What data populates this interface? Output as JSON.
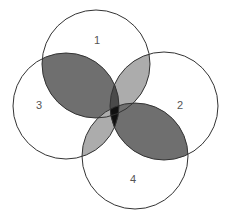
{
  "diagram": {
    "type": "venn",
    "sets": [
      {
        "id": "1",
        "label": "1",
        "cx": 96,
        "cy": 64,
        "r": 54,
        "label_x": 97,
        "label_y": 44
      },
      {
        "id": "2",
        "label": "2",
        "cx": 164,
        "cy": 106,
        "r": 54,
        "label_x": 180,
        "label_y": 109
      },
      {
        "id": "3",
        "label": "3",
        "cx": 66,
        "cy": 106,
        "r": 53,
        "label_x": 39,
        "label_y": 109
      },
      {
        "id": "4",
        "label": "4",
        "cx": 135,
        "cy": 156,
        "r": 53,
        "label_x": 133,
        "label_y": 183
      }
    ],
    "colors": {
      "outline": "#333333",
      "dark_overlap": "#6f6f6f",
      "light_overlap": "#acacac",
      "center_overlap": "#111111",
      "background": "#ffffff"
    },
    "overlaps": [
      {
        "sets": [
          "1",
          "3"
        ],
        "shade": "dark"
      },
      {
        "sets": [
          "2",
          "4"
        ],
        "shade": "dark"
      },
      {
        "sets": [
          "1",
          "2"
        ],
        "shade": "light"
      },
      {
        "sets": [
          "3",
          "4"
        ],
        "shade": "light"
      },
      {
        "sets": [
          "1",
          "2",
          "3"
        ],
        "shade": "dark"
      },
      {
        "sets": [
          "2",
          "3",
          "4"
        ],
        "shade": "center"
      }
    ]
  }
}
